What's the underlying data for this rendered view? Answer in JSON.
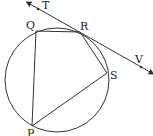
{
  "diagram": {
    "colors": {
      "stroke": "#333333",
      "label": "#222222",
      "background": "#ffffff"
    },
    "circle": {
      "cx": 57,
      "cy": 80,
      "r": 52
    },
    "points": {
      "Q": {
        "label": "Q",
        "x": 36,
        "y": 31
      },
      "R": {
        "label": "R",
        "x": 80,
        "y": 32
      },
      "S": {
        "label": "S",
        "x": 107,
        "y": 73
      },
      "P": {
        "label": "P",
        "x": 32,
        "y": 126
      },
      "T": {
        "label": "T",
        "x": 38,
        "y": 9
      },
      "V": {
        "label": "V",
        "x": 141,
        "y": 68
      }
    },
    "segments": [
      [
        "Q",
        "R"
      ],
      [
        "R",
        "S"
      ],
      [
        "S",
        "P"
      ],
      [
        "P",
        "Q"
      ]
    ],
    "tangent": {
      "through": "R",
      "from": "T",
      "to": "V"
    }
  }
}
